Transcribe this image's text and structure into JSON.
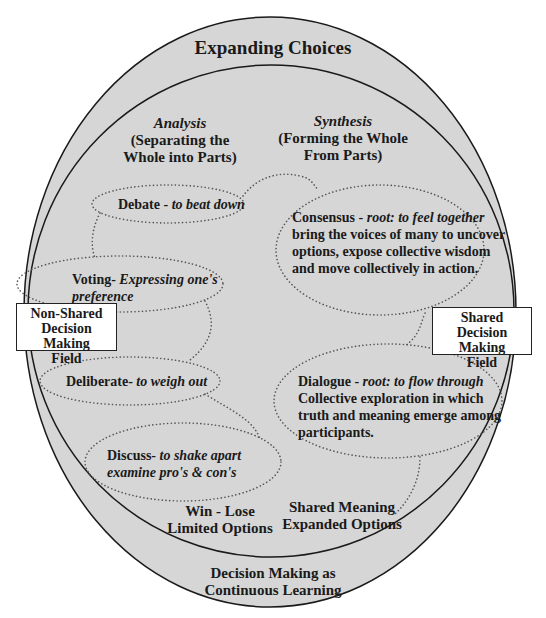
{
  "diagram": {
    "colors": {
      "fill": "#d6d6d6",
      "stroke": "#1a1a1a",
      "dots": "#555555",
      "box_fill": "#ffffff"
    },
    "outer_label": "Expanding Choices",
    "bottom_label": {
      "line1": "Decision Making as",
      "line2": "Continuous Learning"
    },
    "analysis": {
      "heading": "Analysis",
      "line1": "(Separating the",
      "line2": "Whole into Parts)"
    },
    "synthesis": {
      "heading": "Synthesis",
      "line1": "(Forming the Whole",
      "line2": "From Parts)"
    },
    "non_shared_field": {
      "line1": "Non-Shared",
      "line2": "Decision Making",
      "line3": "Field"
    },
    "shared_field": {
      "line1": "Shared",
      "line2": "Decision Making",
      "line3": "Field"
    },
    "bubbles": {
      "debate": {
        "term": "Debate - ",
        "meaning": "to beat down"
      },
      "voting": {
        "term": "Voting- ",
        "meaning1": "Expressing one's",
        "meaning2": "preference"
      },
      "deliberate": {
        "term": "Deliberate- ",
        "meaning": "to weigh out"
      },
      "discuss": {
        "term": "Discuss- ",
        "meaning1": "to shake apart",
        "meaning2": "examine pro's & con's"
      },
      "consensus": {
        "term": "Consensus - ",
        "meaning": "root: to feel together",
        "line2": "bring the voices of many to uncover",
        "line3": "options, expose collective wisdom",
        "line4": "and move collectively in action."
      },
      "dialogue": {
        "term": "Dialogue - ",
        "meaning": "root: to flow through",
        "line2": "Collective exploration in which",
        "line3": "truth and meaning emerge among",
        "line4": "participants."
      }
    },
    "win_lose": {
      "line1": "Win - Lose",
      "line2": "Limited Options"
    },
    "shared_meaning": {
      "line1": "Shared Meaning",
      "line2": "Expanded Options"
    }
  }
}
